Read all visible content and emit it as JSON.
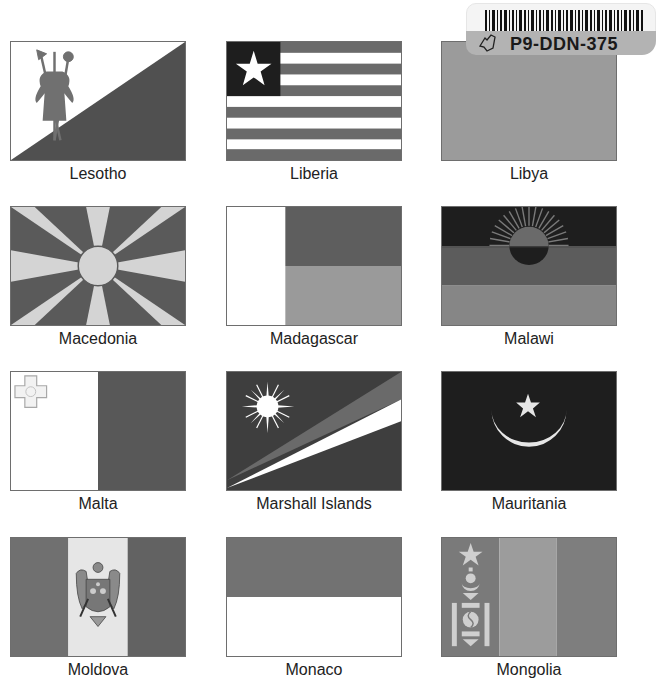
{
  "flags": [
    {
      "name": "Lesotho"
    },
    {
      "name": "Liberia"
    },
    {
      "name": "Libya"
    },
    {
      "name": "Macedonia"
    },
    {
      "name": "Madagascar"
    },
    {
      "name": "Malawi"
    },
    {
      "name": "Malta"
    },
    {
      "name": "Marshall Islands"
    },
    {
      "name": "Mauritania"
    },
    {
      "name": "Moldova"
    },
    {
      "name": "Monaco"
    },
    {
      "name": "Mongolia"
    }
  ],
  "sticker": {
    "code": "P9-DDN-375"
  },
  "colors": {
    "dark": "#3a3a3a",
    "mid": "#6f6f6f",
    "light": "#9a9a9a",
    "pale": "#d6d6d6",
    "black": "#1c1c1c",
    "white": "#ffffff"
  }
}
